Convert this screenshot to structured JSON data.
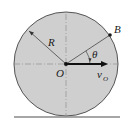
{
  "diagram": {
    "type": "rolling-disk",
    "labels": {
      "radius": "R",
      "center": "O",
      "point": "B",
      "angle": "θ",
      "velocity_main": "v",
      "velocity_sub": "O"
    },
    "colors": {
      "disk_fill": "#cfcfcf",
      "disk_stroke": "#555555",
      "ground": "#888888",
      "ink": "#1a1a1a"
    }
  }
}
